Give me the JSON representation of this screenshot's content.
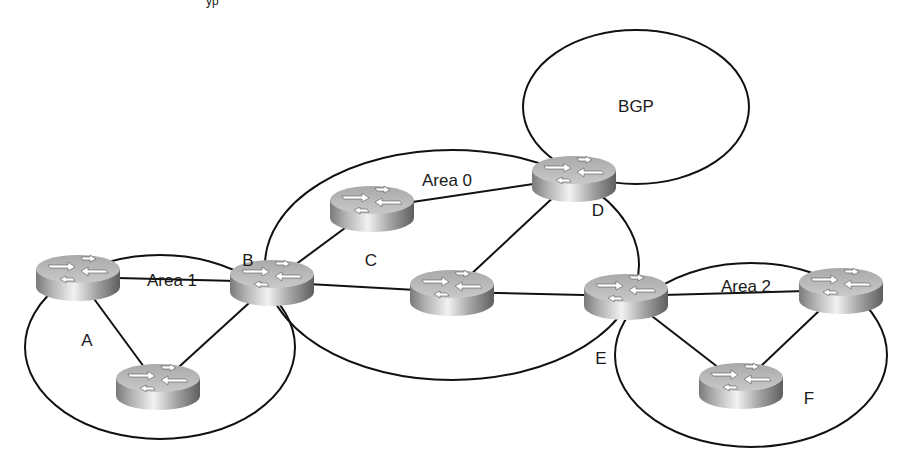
{
  "diagram": {
    "top_fragment": "yp",
    "areas": [
      {
        "id": "area1",
        "label": "Area 1",
        "cx": 160,
        "cy": 347,
        "rx": 135,
        "ry": 92,
        "label_x": 172,
        "label_y": 282
      },
      {
        "id": "area0",
        "label": "Area 0",
        "cx": 452,
        "cy": 265,
        "rx": 187,
        "ry": 115,
        "label_x": 447,
        "label_y": 182
      },
      {
        "id": "bgp",
        "label": "BGP",
        "cx": 636,
        "cy": 107,
        "rx": 113,
        "ry": 77,
        "label_x": 636,
        "label_y": 108
      },
      {
        "id": "area2",
        "label": "Area 2",
        "cx": 751,
        "cy": 355,
        "rx": 136,
        "ry": 92,
        "label_x": 746,
        "label_y": 288
      }
    ],
    "routers": [
      {
        "id": "A",
        "cx": 78,
        "cy": 277
      },
      {
        "id": "B",
        "cx": 272,
        "cy": 282
      },
      {
        "id": "area1-bottom",
        "cx": 158,
        "cy": 386
      },
      {
        "id": "C",
        "cx": 372,
        "cy": 208
      },
      {
        "id": "D",
        "cx": 574,
        "cy": 178
      },
      {
        "id": "area0-middle",
        "cx": 452,
        "cy": 292
      },
      {
        "id": "E",
        "cx": 626,
        "cy": 296
      },
      {
        "id": "area2-right",
        "cx": 841,
        "cy": 290
      },
      {
        "id": "F",
        "cx": 741,
        "cy": 385
      }
    ],
    "router_labels": [
      {
        "text": "A",
        "x": 87,
        "y": 342
      },
      {
        "text": "B",
        "x": 248,
        "y": 262
      },
      {
        "text": "C",
        "x": 371,
        "y": 262
      },
      {
        "text": "D",
        "x": 598,
        "y": 212
      },
      {
        "text": "E",
        "x": 601,
        "y": 360
      },
      {
        "text": "F",
        "x": 809,
        "y": 400
      }
    ],
    "links": [
      [
        "A",
        "B"
      ],
      [
        "A",
        "area1-bottom"
      ],
      [
        "B",
        "area1-bottom"
      ],
      [
        "B",
        "C"
      ],
      [
        "B",
        "area0-middle"
      ],
      [
        "C",
        "D"
      ],
      [
        "D",
        "area0-middle"
      ],
      [
        "area0-middle",
        "E"
      ],
      [
        "E",
        "area2-right"
      ],
      [
        "E",
        "F"
      ],
      [
        "area2-right",
        "F"
      ]
    ],
    "colors": {
      "line": "#111111",
      "router_top": "#b8b8b8",
      "router_side_light": "#e6e6e6",
      "router_side_dark": "#6e6e6e",
      "background": "#ffffff"
    }
  }
}
